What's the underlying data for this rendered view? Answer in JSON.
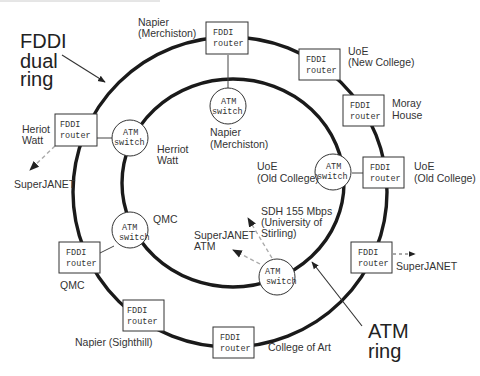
{
  "diagram": {
    "title_labels": {
      "fddi_line1": "FDDI",
      "fddi_line2": "dual",
      "fddi_line3": "ring",
      "atm_line1": "ATM",
      "atm_line2": "ring"
    },
    "device_text": {
      "router_line1": "FDDI",
      "router_line2": "router",
      "switch_line1": "ATM",
      "switch_line2": "switch"
    },
    "routers": [
      {
        "id": "napier-merchiston",
        "label": [
          "Napier",
          "(Merchiston)"
        ]
      },
      {
        "id": "uoe-new-college",
        "label": [
          "UoE",
          "(New College)"
        ]
      },
      {
        "id": "moray-house",
        "label": [
          "Moray",
          "House"
        ]
      },
      {
        "id": "uoe-old-college",
        "label": [
          "UoE",
          "(Old College)"
        ]
      },
      {
        "id": "superjanet-east",
        "label": [
          "SuperJANET"
        ]
      },
      {
        "id": "college-of-art",
        "label": [
          "College of Art"
        ]
      },
      {
        "id": "napier-sighthill",
        "label": [
          "Napier (Sighthill)"
        ]
      },
      {
        "id": "qmc",
        "label": [
          "QMC"
        ]
      },
      {
        "id": "heriot-watt",
        "label": [
          "Heriot",
          "Watt"
        ]
      }
    ],
    "switches": [
      {
        "id": "napier-merchiston",
        "label": [
          "Napier",
          "(Merchiston)"
        ]
      },
      {
        "id": "herriot-watt",
        "label": [
          "Herriot",
          "Watt"
        ]
      },
      {
        "id": "qmc",
        "label": [
          "QMC"
        ]
      },
      {
        "id": "uoe-old-college",
        "label": [
          "UoE",
          "(Old College)"
        ]
      },
      {
        "id": "stirling",
        "label": []
      }
    ],
    "external_links": {
      "heriot_watt_superjanet": "SuperJANET",
      "east_superjanet": "SuperJANET",
      "superjanet_atm": [
        "SuperJANET",
        "ATM"
      ],
      "sdh": [
        "SDH 155 Mbps",
        "(University of",
        "Stirling)"
      ]
    }
  }
}
